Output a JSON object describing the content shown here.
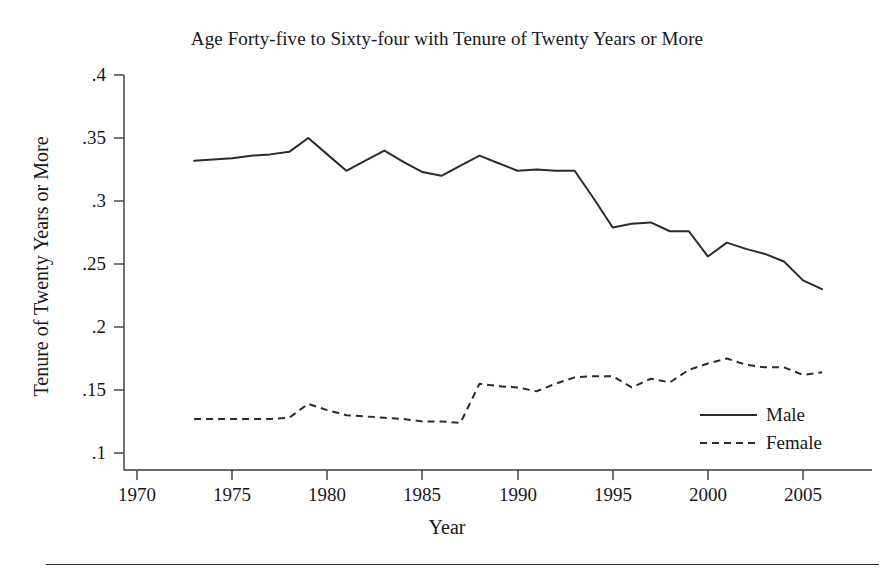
{
  "chart_data": {
    "type": "line",
    "title": "Age Forty-five to Sixty-four with Tenure of Twenty Years or More",
    "xlabel": "Year",
    "ylabel": "Tenure of Twenty Years or More",
    "xlim": [
      1968.5,
      2007.5
    ],
    "ylim": [
      0.1,
      0.4
    ],
    "grid": false,
    "legend_position": "lower-right-inside",
    "xticks": [
      1970,
      1975,
      1980,
      1985,
      1990,
      1995,
      2000,
      2005
    ],
    "xtick_labels": [
      "1970",
      "1975",
      "1980",
      "1985",
      "1990",
      "1995",
      "2000",
      "2005"
    ],
    "yticks": [
      0.1,
      0.15,
      0.2,
      0.25,
      0.3,
      0.35,
      0.4
    ],
    "ytick_labels": [
      ".1",
      ".15",
      ".2",
      ".25",
      ".3",
      ".35",
      ".4"
    ],
    "x": [
      1973,
      1974,
      1975,
      1976,
      1977,
      1978,
      1979,
      1980,
      1981,
      1982,
      1983,
      1984,
      1985,
      1986,
      1987,
      1988,
      1989,
      1990,
      1991,
      1992,
      1993,
      1994,
      1995,
      1996,
      1997,
      1998,
      1999,
      2000,
      2001,
      2002,
      2003,
      2004,
      2005,
      2006
    ],
    "series": [
      {
        "name": "Male",
        "style": "solid",
        "color": "#2b2b2b",
        "values": [
          0.332,
          0.333,
          0.334,
          0.336,
          0.337,
          0.339,
          0.35,
          0.337,
          0.324,
          0.332,
          0.34,
          0.331,
          0.323,
          0.32,
          0.328,
          0.336,
          0.33,
          0.324,
          0.325,
          0.324,
          0.324,
          0.302,
          0.279,
          0.282,
          0.283,
          0.276,
          0.276,
          0.256,
          0.267,
          0.262,
          0.258,
          0.252,
          0.237,
          0.23
        ]
      },
      {
        "name": "Female",
        "style": "dashed",
        "color": "#2b2b2b",
        "values": [
          0.127,
          0.127,
          0.127,
          0.127,
          0.127,
          0.128,
          0.139,
          0.134,
          0.13,
          0.129,
          0.128,
          0.127,
          0.125,
          0.125,
          0.124,
          0.155,
          0.153,
          0.152,
          0.149,
          0.155,
          0.16,
          0.161,
          0.161,
          0.152,
          0.159,
          0.156,
          0.166,
          0.171,
          0.175,
          0.17,
          0.168,
          0.168,
          0.162,
          0.164
        ]
      }
    ]
  },
  "legend": {
    "entries": [
      {
        "label": "Male",
        "style": "solid"
      },
      {
        "label": "Female",
        "style": "dashed"
      }
    ]
  }
}
